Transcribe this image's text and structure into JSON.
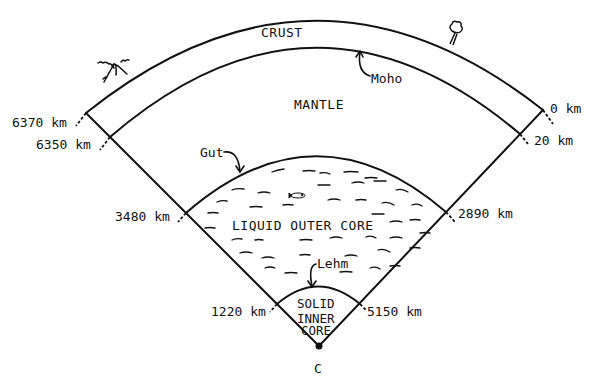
{
  "figure": {
    "regions": {
      "crust": "CRUST",
      "mantle": "MANTLE",
      "outer_core": "LIQUID OUTER CORE",
      "inner_core_line1": "SOLID",
      "inner_core_line2": "INNER",
      "inner_core_line3": "CORE"
    },
    "discontinuities": {
      "moho": "Moho",
      "gutenberg": "Gut",
      "lehmann": "Lehm"
    },
    "radius_labels": {
      "surface": "6370 km",
      "moho": "6350 km",
      "cmb": "3480 km",
      "icb": "1220 km"
    },
    "depth_labels": {
      "surface": "0 km",
      "moho": "20 km",
      "cmb": "2890 km",
      "icb": "5150 km"
    },
    "center_label": "C",
    "decorations": [
      "volcano-icon",
      "tree-icon",
      "fish-icon"
    ]
  }
}
